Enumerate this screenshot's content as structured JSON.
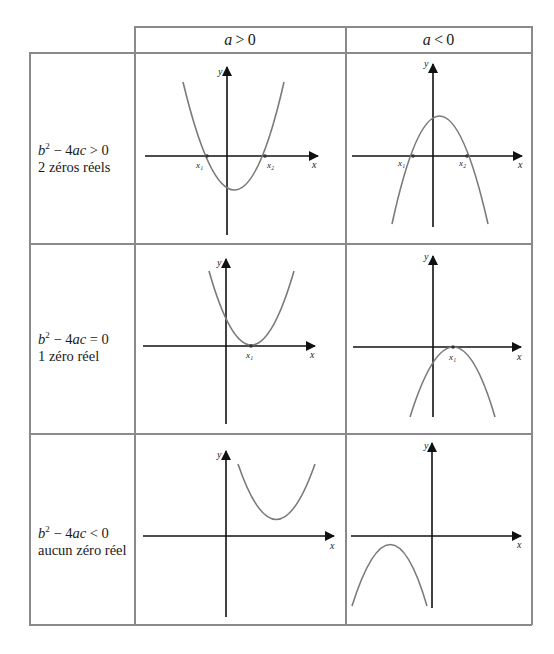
{
  "table": {
    "headers": [
      {
        "label": "a > 0",
        "var": "a",
        "op": ">",
        "rhs": "0"
      },
      {
        "label": "a < 0",
        "var": "a",
        "op": "<",
        "rhs": "0"
      }
    ],
    "rows": [
      {
        "condition": "b² − 4ac > 0",
        "cond_b": "b",
        "cond_exp": "2",
        "cond_mid": " − 4",
        "cond_ac": "ac",
        "cond_rest": " > 0",
        "description": "2 zéros réels"
      },
      {
        "condition": "b² − 4ac = 0",
        "cond_b": "b",
        "cond_exp": "2",
        "cond_mid": " − 4",
        "cond_ac": "ac",
        "cond_rest": " = 0",
        "description": "1 zéro réel"
      },
      {
        "condition": "b² − 4ac < 0",
        "cond_b": "b",
        "cond_exp": "2",
        "cond_mid": " − 4",
        "cond_ac": "ac",
        "cond_rest": " < 0",
        "description": "aucun zéro réel"
      }
    ]
  },
  "axes": {
    "x_label": "x",
    "y_label": "y"
  },
  "graphs": [
    {
      "id": "pos-two-zeros",
      "opens": "up",
      "zeros": [
        "x1",
        "x2"
      ],
      "zero_labels": [
        "x₁",
        "x₂"
      ]
    },
    {
      "id": "neg-two-zeros",
      "opens": "down",
      "zeros": [
        "x1",
        "x2"
      ],
      "zero_labels": [
        "x₁",
        "x₂"
      ]
    },
    {
      "id": "pos-one-zero",
      "opens": "up",
      "zeros": [
        "x1"
      ],
      "zero_labels": [
        "x₁"
      ]
    },
    {
      "id": "neg-one-zero",
      "opens": "down",
      "zeros": [
        "x1"
      ],
      "zero_labels": [
        "x₁"
      ]
    },
    {
      "id": "pos-no-zero",
      "opens": "up",
      "zeros": [],
      "zero_labels": []
    },
    {
      "id": "neg-no-zero",
      "opens": "down",
      "zeros": [],
      "zero_labels": []
    }
  ],
  "colors": {
    "grid": "#8a8a8a",
    "axis": "#111111",
    "curve": "#7a7a7a"
  }
}
